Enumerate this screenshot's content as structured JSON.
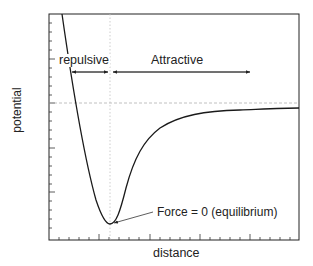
{
  "diagram": {
    "type": "potential energy vs distance curve",
    "xlabel": "distance",
    "ylabel": "potential",
    "regions": {
      "repulsive": "repulsive",
      "attractive": "Attractive"
    },
    "annotation": "Force = 0 (equilibrium)",
    "colors": {
      "curve": "#1a1a1a",
      "frame": "#222222",
      "guides": "#b0b0b0"
    }
  }
}
